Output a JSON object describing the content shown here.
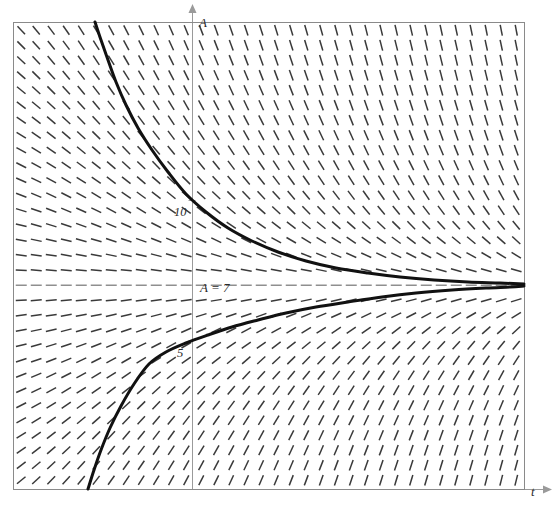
{
  "figure": {
    "kind": "slope-field",
    "title": "",
    "background": "#ffffff",
    "frame": {
      "x": 13,
      "y": 22,
      "width": 511,
      "height": 467,
      "stroke": "#8a8a8a",
      "stroke_width": 1
    }
  },
  "axes": {
    "vertical": {
      "label": "A",
      "pixel_x": 192,
      "stroke": "#9a9a9a",
      "arrow": "up",
      "label_pos": {
        "x": 199,
        "y": 15
      }
    },
    "horizontal": {
      "label": "t",
      "pixel_y": 489,
      "stroke": "#9a9a9a",
      "arrow": "right",
      "label_pos": {
        "x": 531,
        "y": 484
      }
    },
    "ticks": [
      {
        "label": "10",
        "value": 10,
        "pixel_y": 200,
        "label_pos": {
          "x": 174,
          "y": 205
        }
      },
      {
        "label": "5",
        "value": 5,
        "pixel_y": 340,
        "label_pos": {
          "x": 177,
          "y": 346
        }
      }
    ],
    "scale_px_per_unit": 28
  },
  "equilibrium": {
    "label": "A = 7",
    "value": 7,
    "pixel_y": 285,
    "dash_color": "#8f8f8f",
    "label_pos": {
      "x": 200,
      "y": 280
    }
  },
  "chart_data": {
    "type": "line",
    "title": "",
    "xlabel": "t",
    "ylabel": "A",
    "grid": false,
    "legend": "none",
    "field": {
      "description": "slope field of autonomous ODE with stable equilibrium A = 7",
      "equilibrium_value": 7,
      "dash_spacing_px": {
        "x": 15,
        "y": 15
      },
      "dash_length_px": 11,
      "dash_color": "#3a3a3a",
      "slope_sign_above_equilibrium": "negative",
      "slope_sign_below_equilibrium": "positive",
      "slope_at_equilibrium": 0,
      "steepness_grows_with": [
        "distance from A = 7",
        "t"
      ]
    },
    "curves": [
      {
        "name": "solution-above",
        "approaches": 7,
        "from": "above",
        "stroke": "#111111",
        "stroke_width": 3,
        "entry_point_px": {
          "x": 95,
          "y": 22
        },
        "crosses_axis_at_value": 10,
        "points_px": [
          [
            95,
            22
          ],
          [
            101,
            40
          ],
          [
            108,
            60
          ],
          [
            116,
            82
          ],
          [
            126,
            105
          ],
          [
            138,
            128
          ],
          [
            152,
            150
          ],
          [
            168,
            172
          ],
          [
            186,
            194
          ],
          [
            206,
            212
          ],
          [
            228,
            228
          ],
          [
            252,
            241
          ],
          [
            278,
            252
          ],
          [
            306,
            261
          ],
          [
            336,
            268
          ],
          [
            368,
            273
          ],
          [
            400,
            277
          ],
          [
            434,
            280
          ],
          [
            468,
            282
          ],
          [
            500,
            283
          ],
          [
            524,
            284
          ]
        ]
      },
      {
        "name": "solution-below",
        "approaches": 7,
        "from": "below",
        "stroke": "#111111",
        "stroke_width": 3,
        "entry_point_px": {
          "x": 88,
          "y": 489
        },
        "crosses_axis_at_value": 5,
        "points_px": [
          [
            88,
            489
          ],
          [
            94,
            470
          ],
          [
            101,
            450
          ],
          [
            110,
            428
          ],
          [
            121,
            406
          ],
          [
            134,
            384
          ],
          [
            149,
            364
          ],
          [
            166,
            352
          ],
          [
            186,
            343
          ],
          [
            208,
            335
          ],
          [
            232,
            327
          ],
          [
            258,
            320
          ],
          [
            286,
            313
          ],
          [
            316,
            307
          ],
          [
            348,
            302
          ],
          [
            382,
            297
          ],
          [
            416,
            293
          ],
          [
            452,
            290
          ],
          [
            486,
            288
          ],
          [
            510,
            287
          ],
          [
            524,
            286
          ]
        ]
      }
    ]
  }
}
